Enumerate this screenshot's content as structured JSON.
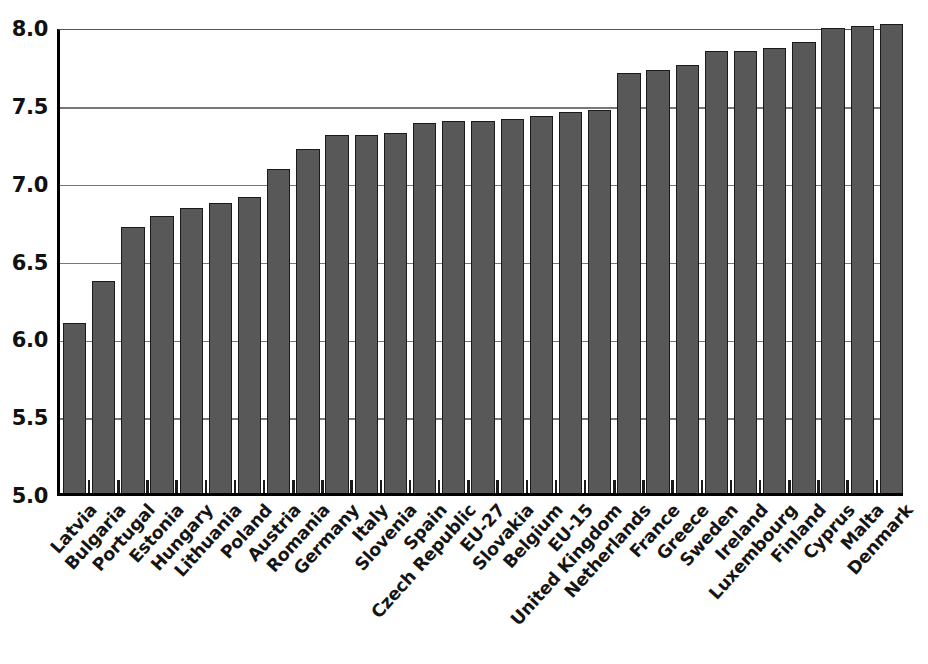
{
  "chart_data": {
    "type": "bar",
    "title": "",
    "subtitle": "",
    "xlabel": "",
    "ylabel": "",
    "ylim": [
      5.0,
      8.0
    ],
    "grid": true,
    "legend": "none",
    "y_ticks": [
      "5.0",
      "5.5",
      "6.0",
      "6.5",
      "7.0",
      "7.5",
      "8.0"
    ],
    "y_tick_values": [
      5.0,
      5.5,
      6.0,
      6.5,
      7.0,
      7.5,
      8.0
    ],
    "categories": [
      "Latvia",
      "Bulgaria",
      "Portugal",
      "Estonia",
      "Hungary",
      "Lithuania",
      "Poland",
      "Austria",
      "Romania",
      "Germany",
      "Italy",
      "Slovenia",
      "Spain",
      "Czech Republic",
      "EU-27",
      "Slovakia",
      "Belgium",
      "EU-15",
      "United Kingdom",
      "Netherlands",
      "France",
      "Greece",
      "Sweden",
      "Ireland",
      "Luxembourg",
      "Finland",
      "Cyprus",
      "Malta",
      "Denmark"
    ],
    "values": [
      6.09,
      6.36,
      6.71,
      6.78,
      6.83,
      6.86,
      6.9,
      7.08,
      7.21,
      7.3,
      7.3,
      7.31,
      7.38,
      7.39,
      7.39,
      7.4,
      7.42,
      7.45,
      7.46,
      7.7,
      7.72,
      7.75,
      7.84,
      7.84,
      7.86,
      7.9,
      7.99,
      8.0,
      8.01
    ],
    "colors": {
      "bar_fill": "#585858",
      "bar_outline": "#1a1a1a",
      "gridline": "#777777",
      "axis": "#000000",
      "background": "#ffffff",
      "text": "#151515"
    }
  }
}
